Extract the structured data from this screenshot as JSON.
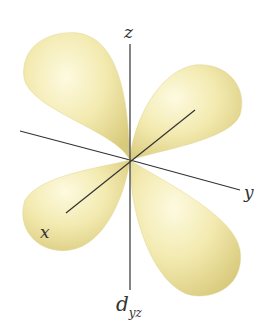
{
  "diagram": {
    "axes": {
      "z": "z",
      "y": "y",
      "x": "x"
    },
    "label": {
      "main": "d",
      "subscript": "yz"
    },
    "colors": {
      "lobe_light": "#fbf6cf",
      "lobe_mid": "#f1e8a6",
      "lobe_dark": "#d4c676",
      "axis": "#333333",
      "background": "#ffffff"
    }
  }
}
